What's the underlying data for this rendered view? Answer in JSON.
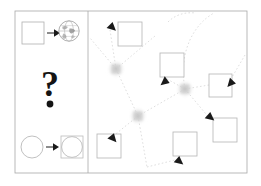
{
  "figure": {
    "background_color": "#ffffff",
    "width": 261,
    "height": 186,
    "frame": {
      "x": 15,
      "y": 11,
      "width": 232,
      "height": 162,
      "stroke_color": "#a8a8a8",
      "stroke_width": 0.8
    },
    "divider": {
      "x": 88,
      "y1": 11,
      "y2": 173,
      "stroke_color": "#a8a8a8",
      "stroke_width": 0.8
    }
  },
  "left_panel": {
    "name": "legend-panel",
    "label": "Legend / key panel",
    "rows": [
      {
        "id": "row-square-to-globe",
        "label": "square maps to globe",
        "source": {
          "shape": "square",
          "name": "empty-square-glyph",
          "x": 22,
          "y": 22,
          "size": 22,
          "stroke": "#b0b0b0"
        },
        "arrow": {
          "name": "right-arrow-icon",
          "x1": 47,
          "y1": 33,
          "x2": 58,
          "y2": 33,
          "color": "#1a1a1a"
        },
        "target": {
          "shape": "globe",
          "name": "globe-icon",
          "cx": 69,
          "cy": 31,
          "r": 10.5,
          "stroke": "#9a9a9a"
        }
      },
      {
        "id": "row-question",
        "label": "unknown mapping",
        "glyph": {
          "shape": "question-mark",
          "name": "question-mark-glyph",
          "text": "?",
          "x": 50,
          "y": 96,
          "font_size": 34,
          "color": "#141414"
        },
        "dot": {
          "name": "question-dot-glyph",
          "cx": 50,
          "cy": 104,
          "r": 3.4,
          "color": "#141414"
        }
      },
      {
        "id": "row-circle-to-boxed-circle",
        "label": "circle maps to boxed circle",
        "source": {
          "shape": "circle",
          "name": "empty-circle-glyph",
          "cx": 32,
          "cy": 147,
          "r": 11,
          "stroke": "#b0b0b0"
        },
        "arrow": {
          "name": "right-arrow-icon",
          "x1": 46,
          "y1": 147,
          "x2": 57,
          "y2": 147,
          "color": "#1a1a1a"
        },
        "target": {
          "shape": "square-with-inscribed-circle",
          "name": "boxed-circle-glyph",
          "x": 61,
          "y": 136,
          "size": 22,
          "stroke": "#bcbcbc",
          "inner_circle": {
            "cx": 72,
            "cy": 147,
            "r": 10.5,
            "stroke": "#b4b4b4"
          }
        }
      }
    ]
  },
  "right_panel": {
    "name": "network-graph-panel",
    "label": "Network graph panel",
    "edge_style": {
      "stroke_color": "#d6d6d6",
      "stroke_width": 0.8,
      "dash_pattern": "1.6 2.2"
    },
    "square_nodes": [
      {
        "id": "n1",
        "name": "graph-node-square",
        "x": 118,
        "y": 22,
        "size": 24,
        "stroke": "#b8b8b8"
      },
      {
        "id": "n2",
        "name": "graph-node-square",
        "x": 160,
        "y": 53,
        "size": 24,
        "stroke": "#b8b8b8"
      },
      {
        "id": "n3",
        "name": "graph-node-square",
        "x": 209,
        "y": 74,
        "size": 23,
        "stroke": "#b8b8b8"
      },
      {
        "id": "n4",
        "name": "graph-node-square",
        "x": 213,
        "y": 118,
        "size": 24,
        "stroke": "#b8b8b8"
      },
      {
        "id": "n5",
        "name": "graph-node-square",
        "x": 173,
        "y": 132,
        "size": 24,
        "stroke": "#b8b8b8"
      },
      {
        "id": "n6",
        "name": "graph-node-square",
        "x": 97,
        "y": 134,
        "size": 24,
        "stroke": "#b8b8b8"
      }
    ],
    "hub_nodes": [
      {
        "id": "h1",
        "name": "graph-hub-blur-node",
        "cx": 116,
        "cy": 69,
        "r": 9.5,
        "color": "#c9c9c9"
      },
      {
        "id": "h2",
        "name": "graph-hub-blur-node",
        "cx": 185,
        "cy": 89,
        "r": 9.5,
        "color": "#c9c9c9"
      },
      {
        "id": "h3",
        "name": "graph-hub-blur-node",
        "cx": 138,
        "cy": 116,
        "r": 9.5,
        "color": "#c9c9c9"
      }
    ],
    "edges": [
      {
        "from": "h1",
        "to": "n1",
        "path": "M116,69 L110,32"
      },
      {
        "from": "h1",
        "to": "edge-top-left",
        "path": "M116,69 L92,40"
      },
      {
        "from": "h1",
        "to": "h3",
        "path": "M116,69 L138,116"
      },
      {
        "from": "h1",
        "to": "n2",
        "path": "M116,69 L152,40"
      },
      {
        "from": "h2",
        "to": "n2",
        "path": "M185,89 L168,80"
      },
      {
        "from": "h2",
        "to": "arc-upper",
        "path": "M185,89 C180,50 196,22 216,12"
      },
      {
        "from": "h2",
        "to": "n3",
        "path": "M185,89 L232,80"
      },
      {
        "from": "h2",
        "to": "h3",
        "path": "M185,89 L138,116"
      },
      {
        "from": "h2",
        "to": "n4",
        "path": "M185,89 L212,122"
      },
      {
        "from": "h3",
        "to": "n6",
        "path": "M138,116 L110,138"
      },
      {
        "from": "h3",
        "to": "bottom",
        "path": "M138,116 L146,166"
      },
      {
        "from": "bottom",
        "to": "n5",
        "path": "M146,166 L178,158"
      },
      {
        "from": "edge-right",
        "to": "n3",
        "path": "M243,60 L228,82"
      }
    ],
    "arrowheads": [
      {
        "id": "a1",
        "name": "graph-arrowhead",
        "x": 110,
        "y": 24,
        "angle": 300,
        "color": "#1a1a1a"
      },
      {
        "id": "a2",
        "name": "graph-arrowhead",
        "x": 166,
        "y": 81,
        "angle": 40,
        "color": "#1a1a1a"
      },
      {
        "id": "a3",
        "name": "graph-arrowhead",
        "x": 231,
        "y": 82,
        "angle": 20,
        "color": "#1a1a1a"
      },
      {
        "id": "a4",
        "name": "graph-arrowhead",
        "x": 209,
        "y": 117,
        "angle": 300,
        "color": "#1a1a1a"
      },
      {
        "id": "a5",
        "name": "graph-arrowhead",
        "x": 111,
        "y": 136,
        "angle": 310,
        "color": "#1a1a1a"
      },
      {
        "id": "a6",
        "name": "graph-arrowhead",
        "x": 177,
        "y": 160,
        "angle": 300,
        "color": "#1a1a1a"
      }
    ]
  }
}
